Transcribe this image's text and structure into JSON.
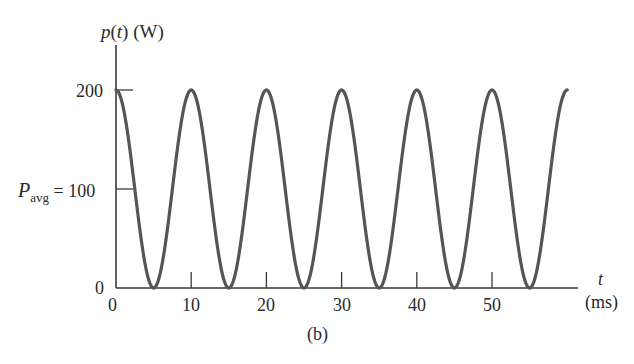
{
  "chart_data": {
    "type": "line",
    "title": "",
    "xlabel": "t",
    "xlabel_unit": "(ms)",
    "ylabel": "p(t) (W)",
    "caption": "(b)",
    "xlim": [
      0,
      60
    ],
    "ylim": [
      0,
      240
    ],
    "x_ticks": [
      0,
      10,
      20,
      30,
      40,
      50
    ],
    "y_ticks": [
      0,
      100,
      200
    ],
    "y_tick_labels": [
      "0",
      "Pavg = 100",
      "200"
    ],
    "grid": false,
    "legend": null,
    "series": [
      {
        "name": "p(t)",
        "formula": "p(t) = 100 + 100*cos(2*pi*t/10)",
        "x": [
          0,
          2.5,
          5,
          7.5,
          10,
          12.5,
          15,
          17.5,
          20,
          22.5,
          25,
          27.5,
          30,
          32.5,
          35,
          37.5,
          40,
          42.5,
          45,
          47.5,
          50,
          52.5,
          55,
          57.5,
          60
        ],
        "values": [
          200,
          100,
          0,
          100,
          200,
          100,
          0,
          100,
          200,
          100,
          0,
          100,
          200,
          100,
          0,
          100,
          200,
          100,
          0,
          100,
          200,
          100,
          0,
          100,
          200
        ],
        "color": "#555555"
      }
    ],
    "annotations": [
      {
        "text": "Pavg = 100",
        "at_y": 100
      }
    ]
  },
  "labels": {
    "ylabel_p": "p",
    "ylabel_t": "t",
    "ylabel_rest": "(W)",
    "y200": "200",
    "pavg_P": "P",
    "pavg_sub": "avg",
    "pavg_eq": "= 100",
    "y0": "0",
    "x0": "0",
    "x10": "10",
    "x20": "20",
    "x30": "30",
    "x40": "40",
    "x50": "50",
    "xlabel_t": "t",
    "xlabel_unit": "(ms)",
    "caption": "(b)"
  },
  "colors": {
    "axis": "#3a3a3a",
    "curve": "#555555",
    "background": "#ffffff"
  }
}
